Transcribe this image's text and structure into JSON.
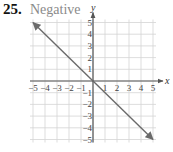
{
  "exercise": {
    "number": "25.",
    "answer": "Negative"
  },
  "colors": {
    "grid": "#d4d4d4",
    "axis": "#555555",
    "line": "#6a6a6a",
    "answer_text": "#8a8a8a"
  },
  "chart_data": {
    "type": "line",
    "title": "Negative",
    "xlabel": "x",
    "ylabel": "y",
    "xlim": [
      -5,
      5
    ],
    "ylim": [
      -5,
      5
    ],
    "grid": true,
    "x_ticks": [
      "-5",
      "-4",
      "-3",
      "-2",
      "-1",
      "1",
      "2",
      "3",
      "4",
      "5"
    ],
    "y_ticks": [
      "5",
      "4",
      "3",
      "2",
      "1",
      "-1",
      "-2",
      "-3",
      "-4",
      "-5"
    ],
    "series": [
      {
        "name": "y = -x",
        "x": [
          -5,
          0,
          5
        ],
        "y": [
          5,
          0,
          -5
        ],
        "arrows_both_ends": true
      }
    ],
    "annotations": [
      "Negative"
    ]
  }
}
